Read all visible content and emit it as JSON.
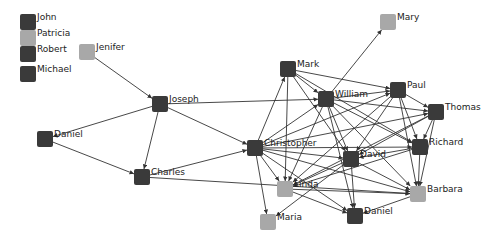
{
  "colors": {
    "dark": "#3a3a3a",
    "light": "#a8a8a8",
    "edge": "#333333",
    "text": "#222222"
  },
  "legend": [
    {
      "id": "John",
      "label": "John",
      "x": 28,
      "y": 22,
      "shade": "dark"
    },
    {
      "id": "Patricia",
      "label": "Patricia",
      "x": 28,
      "y": 38,
      "shade": "light"
    },
    {
      "id": "Robert",
      "label": "Robert",
      "x": 28,
      "y": 54,
      "shade": "dark"
    },
    {
      "id": "Michael",
      "label": "Michael",
      "x": 28,
      "y": 74,
      "shade": "dark"
    }
  ],
  "nodes": [
    {
      "id": "Jenifer",
      "label": "Jenifer",
      "x": 87,
      "y": 52,
      "shade": "light"
    },
    {
      "id": "Joseph",
      "label": "Joseph",
      "x": 160,
      "y": 104,
      "shade": "dark"
    },
    {
      "id": "Daniel1",
      "label": "Daniel",
      "x": 45,
      "y": 139,
      "shade": "dark"
    },
    {
      "id": "Charles",
      "label": "Charles",
      "x": 142,
      "y": 177,
      "shade": "dark"
    },
    {
      "id": "Christopher",
      "label": "Christopher",
      "x": 255,
      "y": 148,
      "shade": "dark"
    },
    {
      "id": "Mark",
      "label": "Mark",
      "x": 288,
      "y": 69,
      "shade": "dark"
    },
    {
      "id": "William",
      "label": "William",
      "x": 326,
      "y": 99,
      "shade": "dark"
    },
    {
      "id": "Mary",
      "label": "Mary",
      "x": 388,
      "y": 22,
      "shade": "light"
    },
    {
      "id": "Paul",
      "label": "Paul",
      "x": 398,
      "y": 90,
      "shade": "dark"
    },
    {
      "id": "Thomas",
      "label": "Thomas",
      "x": 436,
      "y": 112,
      "shade": "dark"
    },
    {
      "id": "Richard",
      "label": "Richard",
      "x": 420,
      "y": 147,
      "shade": "dark"
    },
    {
      "id": "David",
      "label": "David",
      "x": 351,
      "y": 159,
      "shade": "dark"
    },
    {
      "id": "Barbara",
      "label": "Barbara",
      "x": 418,
      "y": 194,
      "shade": "light"
    },
    {
      "id": "Linda",
      "label": "Linda",
      "x": 285,
      "y": 189,
      "shade": "light"
    },
    {
      "id": "Maria",
      "label": "Maria",
      "x": 268,
      "y": 222,
      "shade": "light"
    },
    {
      "id": "Daniel2",
      "label": "Daniel",
      "x": 355,
      "y": 216,
      "shade": "dark"
    }
  ],
  "edges": [
    [
      "Jenifer",
      "Joseph"
    ],
    [
      "Joseph",
      "Daniel1"
    ],
    [
      "Joseph",
      "Charles"
    ],
    [
      "Joseph",
      "Christopher"
    ],
    [
      "Joseph",
      "William"
    ],
    [
      "Daniel1",
      "Charles"
    ],
    [
      "Charles",
      "Christopher"
    ],
    [
      "Charles",
      "Barbara"
    ],
    [
      "Christopher",
      "Mark"
    ],
    [
      "Christopher",
      "William"
    ],
    [
      "Christopher",
      "Paul"
    ],
    [
      "Christopher",
      "Thomas"
    ],
    [
      "Christopher",
      "Richard"
    ],
    [
      "Christopher",
      "David"
    ],
    [
      "Christopher",
      "Barbara"
    ],
    [
      "Christopher",
      "Linda"
    ],
    [
      "Christopher",
      "Maria"
    ],
    [
      "Christopher",
      "Daniel2"
    ],
    [
      "Mark",
      "William"
    ],
    [
      "Mark",
      "Paul"
    ],
    [
      "Mark",
      "David"
    ],
    [
      "Mark",
      "Richard"
    ],
    [
      "Mark",
      "Linda"
    ],
    [
      "William",
      "Mary"
    ],
    [
      "William",
      "Paul"
    ],
    [
      "William",
      "Thomas"
    ],
    [
      "William",
      "Richard"
    ],
    [
      "William",
      "David"
    ],
    [
      "William",
      "Barbara"
    ],
    [
      "William",
      "Linda"
    ],
    [
      "William",
      "Daniel2"
    ],
    [
      "Paul",
      "Thomas"
    ],
    [
      "Paul",
      "Richard"
    ],
    [
      "Paul",
      "David"
    ],
    [
      "Paul",
      "Barbara"
    ],
    [
      "Paul",
      "Linda"
    ],
    [
      "Thomas",
      "Richard"
    ],
    [
      "Thomas",
      "David"
    ],
    [
      "Thomas",
      "Barbara"
    ],
    [
      "Thomas",
      "Linda"
    ],
    [
      "Richard",
      "David"
    ],
    [
      "Richard",
      "Barbara"
    ],
    [
      "Richard",
      "Linda"
    ],
    [
      "David",
      "Barbara"
    ],
    [
      "David",
      "Linda"
    ],
    [
      "David",
      "Daniel2"
    ],
    [
      "David",
      "Maria"
    ],
    [
      "Linda",
      "Barbara"
    ],
    [
      "Linda",
      "Daniel2"
    ],
    [
      "Barbara",
      "Daniel2"
    ]
  ]
}
